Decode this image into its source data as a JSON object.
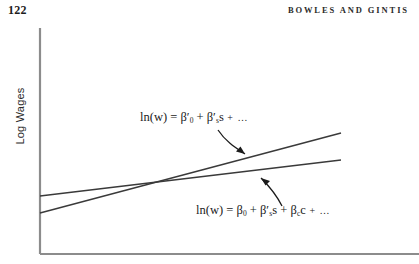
{
  "page": {
    "number": "122",
    "running_head": "BOWLES AND GINTIS"
  },
  "figure": {
    "y_axis_label": "Log Wages",
    "equations": {
      "upper": {
        "lhs": "ln(w) = ",
        "term1_symbol": "β′",
        "term1_sub": "0",
        "plus1": " + ",
        "term2_symbol": "β′",
        "term2_sub": "s",
        "term2_var": "s",
        "tail": " + …"
      },
      "lower": {
        "lhs": "ln(w) = ",
        "term1_symbol": "β",
        "term1_sub": "0",
        "plus1": " + ",
        "term2_symbol": "β′",
        "term2_sub": "s",
        "term2_var": "s",
        "plus2": " + ",
        "term3_symbol": "β",
        "term3_sub": "c",
        "term3_var": "c",
        "tail": " + …"
      }
    },
    "lines": [
      {
        "name": "steep-line",
        "x1": 40,
        "y1": 195,
        "x2": 341,
        "y2": 115
      },
      {
        "name": "flat-line",
        "x1": 40,
        "y1": 178,
        "x2": 341,
        "y2": 142
      }
    ],
    "colors": {
      "axis": "#8c8c8c",
      "line": "#3a3a3a",
      "text": "#1b1b1b",
      "arrow": "#1b1b1b"
    }
  }
}
